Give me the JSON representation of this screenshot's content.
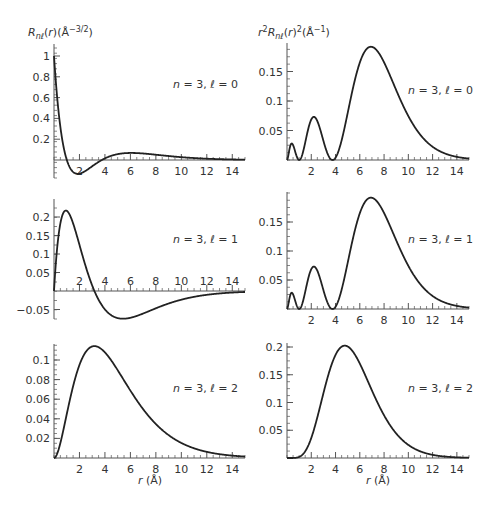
{
  "figure": {
    "left_column_ylabel": "R_nℓ(r)(Å^-3/2)",
    "right_column_ylabel": "r²R_nℓ(r)²(Å^-1)",
    "xlabel": "r (Å)",
    "caption_partial": ""
  },
  "chart_data": [
    {
      "id": "R30",
      "type": "line",
      "title": "n = 3, ℓ = 0",
      "ylabel": "R_nℓ(r)(Å^-3/2)",
      "xlabel": "",
      "xlim": [
        0,
        15
      ],
      "ylim": [
        -0.15,
        1.1
      ],
      "xticks": [
        2,
        4,
        6,
        8,
        10,
        12,
        14
      ],
      "yticks": [
        0.2,
        0.4,
        0.6,
        0.8,
        1
      ],
      "ytick_labels": [
        "0.2",
        "0.4",
        "0.6",
        "0.8",
        "1"
      ],
      "function": "R30",
      "x": [
        0,
        1,
        1.9,
        3,
        4,
        5,
        6.5,
        8,
        10,
        12,
        14,
        15
      ],
      "y": [
        1.0,
        0.12,
        -0.12,
        -0.07,
        0.0,
        0.04,
        0.055,
        0.045,
        0.025,
        0.011,
        0.005,
        0.003
      ]
    },
    {
      "id": "P30",
      "type": "line",
      "title": "n = 3, ℓ = 0",
      "ylabel": "r²R_nℓ(r)²(Å^-1)",
      "xlabel": "",
      "xlim": [
        0,
        15
      ],
      "ylim": [
        0,
        0.2
      ],
      "xticks": [
        2,
        4,
        6,
        8,
        10,
        12,
        14
      ],
      "yticks": [
        0.05,
        0.1,
        0.15
      ],
      "ytick_labels": [
        "0.05",
        "0.1",
        "0.15"
      ],
      "function": "P30",
      "x": [
        0,
        0.4,
        1.0,
        2.2,
        3.8,
        5,
        7,
        9,
        11,
        13,
        15
      ],
      "y": [
        0,
        0.027,
        0,
        0.072,
        0,
        0.09,
        0.19,
        0.14,
        0.06,
        0.02,
        0.005
      ]
    },
    {
      "id": "R31",
      "type": "line",
      "title": "n = 3, ℓ = 1",
      "ylabel": "",
      "xlabel": "",
      "xlim": [
        0,
        15
      ],
      "ylim": [
        -0.07,
        0.25
      ],
      "xticks": [
        2,
        4,
        6,
        8,
        10,
        12,
        14
      ],
      "yticks": [
        -0.05,
        0.05,
        0.1,
        0.15,
        0.2
      ],
      "ytick_labels": [
        "−0.05",
        "0.05",
        "0.1",
        "0.15",
        "0.2"
      ],
      "function": "R31",
      "x": [
        0,
        1.0,
        2,
        3.17,
        4,
        5.5,
        8,
        10,
        12,
        15
      ],
      "y": [
        0,
        0.215,
        0.14,
        0,
        -0.04,
        -0.068,
        -0.05,
        -0.03,
        -0.015,
        -0.005
      ]
    },
    {
      "id": "P31",
      "type": "line",
      "title": "n = 3, ℓ = 1",
      "ylabel": "",
      "xlabel": "",
      "xlim": [
        0,
        15
      ],
      "ylim": [
        0,
        0.2
      ],
      "xticks": [
        2,
        4,
        6,
        8,
        10,
        12,
        14
      ],
      "yticks": [
        0.05,
        0.1,
        0.15
      ],
      "ytick_labels": [
        "0.05",
        "0.1",
        "0.15"
      ],
      "function": "P30",
      "x": [
        0,
        0.4,
        1.0,
        2.2,
        3.8,
        5,
        7,
        9,
        11,
        13,
        15
      ],
      "y": [
        0,
        0.027,
        0,
        0.072,
        0,
        0.09,
        0.19,
        0.14,
        0.06,
        0.02,
        0.005
      ]
    },
    {
      "id": "R32",
      "type": "line",
      "title": "n = 3, ℓ = 2",
      "ylabel": "",
      "xlabel": "r (Å)",
      "xlim": [
        0,
        15
      ],
      "ylim": [
        0,
        0.115
      ],
      "xticks": [
        2,
        4,
        6,
        8,
        10,
        12,
        14
      ],
      "yticks": [
        0.02,
        0.04,
        0.06,
        0.08,
        0.1
      ],
      "ytick_labels": [
        "0.02",
        "0.04",
        "0.06",
        "0.08",
        "0.1"
      ],
      "function": "R32",
      "x": [
        0,
        1,
        2,
        3.17,
        4,
        6,
        8,
        10,
        12,
        14,
        15
      ],
      "y": [
        0,
        0.035,
        0.085,
        0.112,
        0.105,
        0.068,
        0.035,
        0.015,
        0.006,
        0.002,
        0.001
      ]
    },
    {
      "id": "P32",
      "type": "line",
      "title": "n = 3, ℓ = 2",
      "ylabel": "",
      "xlabel": "r (Å)",
      "xlim": [
        0,
        15
      ],
      "ylim": [
        0,
        0.21
      ],
      "xticks": [
        2,
        4,
        6,
        8,
        10,
        12,
        14
      ],
      "yticks": [
        0.05,
        0.1,
        0.15,
        0.2
      ],
      "ytick_labels": [
        "0.05",
        "0.1",
        "0.15",
        "0.2"
      ],
      "function": "P32",
      "x": [
        0,
        1,
        2,
        3,
        4.76,
        6,
        8,
        10,
        12,
        14,
        15
      ],
      "y": [
        0,
        0.002,
        0.04,
        0.12,
        0.2,
        0.18,
        0.09,
        0.03,
        0.008,
        0.002,
        0.001
      ]
    }
  ],
  "panels_layout": [
    {
      "chart": 0,
      "ox": 54,
      "x15": 245,
      "y0": 160,
      "ppu": 104,
      "ytop": 44,
      "ybot": 178,
      "label_x": 173,
      "label_y": 88,
      "tick_label_side": "below"
    },
    {
      "chart": 1,
      "ox": 287,
      "x15": 469,
      "y0": 160,
      "ppu": 590,
      "ytop": 43,
      "ybot": 160,
      "label_x": 408,
      "label_y": 94,
      "tick_label_side": "below"
    },
    {
      "chart": 2,
      "ox": 54,
      "x15": 245,
      "y0": 291,
      "ppu": 370,
      "ytop": 199,
      "ybot": 319,
      "label_x": 173,
      "label_y": 243,
      "tick_label_side": "above"
    },
    {
      "chart": 3,
      "ox": 287,
      "x15": 469,
      "y0": 309,
      "ppu": 580,
      "ytop": 192,
      "ybot": 309,
      "label_x": 408,
      "label_y": 243,
      "tick_label_side": "below"
    },
    {
      "chart": 4,
      "ox": 54,
      "x15": 245,
      "y0": 458,
      "ppu": 980,
      "ytop": 344,
      "ybot": 458,
      "label_x": 173,
      "label_y": 392,
      "tick_label_side": "below"
    },
    {
      "chart": 5,
      "ox": 287,
      "x15": 469,
      "y0": 458,
      "ppu": 555,
      "ytop": 343,
      "ybot": 458,
      "label_x": 408,
      "label_y": 392,
      "tick_label_side": "below"
    }
  ],
  "style": {
    "line_color": "#222222",
    "axis_color": "#555555",
    "text_color": "#333333"
  }
}
